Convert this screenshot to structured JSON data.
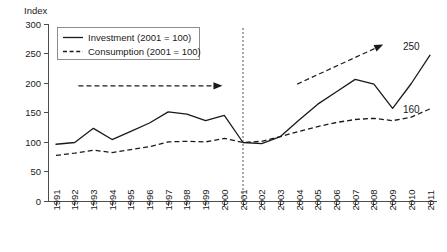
{
  "chart_data": {
    "type": "line",
    "title": "",
    "ylabel": "Index",
    "xlabel": "",
    "ylim": [
      0,
      300
    ],
    "yticks": [
      0,
      50,
      100,
      150,
      200,
      250,
      300
    ],
    "grid": false,
    "legend_position": "top-left",
    "categories": [
      "1991",
      "1992",
      "1993",
      "1994",
      "1995",
      "1996",
      "1997",
      "1998",
      "1999",
      "2000",
      "2001",
      "2002",
      "2003",
      "2004",
      "2005",
      "2006",
      "2007",
      "2008",
      "2009",
      "2010",
      "2011"
    ],
    "series": [
      {
        "name": "Investment (2001 = 100)",
        "style": "solid",
        "values": [
          97,
          100,
          124,
          105,
          119,
          133,
          152,
          148,
          137,
          146,
          100,
          98,
          110,
          138,
          165,
          186,
          207,
          199,
          158,
          200,
          248
        ]
      },
      {
        "name": "Consumption (2001 = 100)",
        "style": "dashed",
        "values": [
          78,
          82,
          87,
          83,
          88,
          93,
          101,
          102,
          101,
          107,
          100,
          102,
          110,
          119,
          127,
          134,
          139,
          141,
          137,
          143,
          157
        ]
      }
    ],
    "annotations": [
      {
        "name": "consumption-trend-arrow",
        "style": "dashed-arrow",
        "from": {
          "x": "1992.2",
          "y": 196
        },
        "to": {
          "x": "1999.9",
          "y": 196
        },
        "label": ""
      },
      {
        "name": "investment-trend-arrow",
        "style": "dashed-arrow",
        "from": {
          "x": "2003.9",
          "y": 199
        },
        "to": {
          "x": "2008.5",
          "y": 266
        },
        "label": ""
      },
      {
        "name": "reference-line-2001",
        "style": "vertical-dotted",
        "at": "2001"
      }
    ],
    "end_labels": [
      {
        "name": "investment-end-value",
        "text": "250",
        "value": 250
      },
      {
        "name": "consumption-end-value",
        "text": "160",
        "value": 160
      }
    ],
    "legend": [
      {
        "label": "Investment (2001 = 100)",
        "style": "solid"
      },
      {
        "label": "Consumption (2001 = 100)",
        "style": "dashed"
      }
    ]
  },
  "yaxis": {
    "title": "Index",
    "labels": [
      "300",
      "250",
      "200",
      "150",
      "100",
      "50",
      "0"
    ]
  },
  "xaxis": {
    "labels": [
      "1991",
      "1992",
      "1993",
      "1994",
      "1995",
      "1996",
      "1997",
      "1998",
      "1999",
      "2000",
      "2001",
      "2002",
      "2003",
      "2004",
      "2005",
      "2006",
      "2007",
      "2008",
      "2009",
      "2010",
      "2011"
    ]
  },
  "legend": {
    "investment_label": "Investment (2001 = 100)",
    "consumption_label": "Consumption (2001 = 100)"
  },
  "labels": {
    "investment_end": "250",
    "consumption_end": "160"
  },
  "colors": {
    "line": "#1a1a1a",
    "axis": "#4d4d4d",
    "marker": "#555555",
    "background": "#ffffff"
  }
}
